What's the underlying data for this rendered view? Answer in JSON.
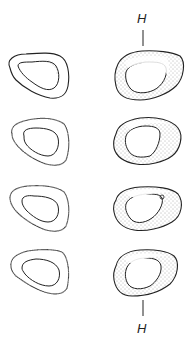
{
  "figure": {
    "columns": [
      {
        "name": "left",
        "sections": 4,
        "stippled": false
      },
      {
        "name": "right",
        "sections": 4,
        "stippled": true
      }
    ],
    "labels": {
      "top": "H",
      "bottom": "H"
    },
    "colors": {
      "stroke": "#222222",
      "stipple": "#555555",
      "background": "#ffffff"
    }
  }
}
